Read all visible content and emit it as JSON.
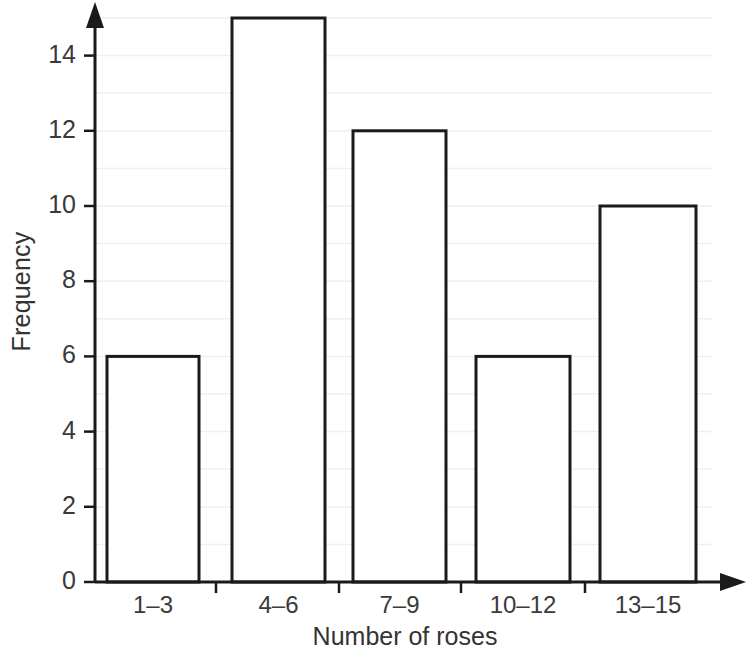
{
  "chart_data": {
    "type": "bar",
    "title": "",
    "subtitle": "",
    "xlabel": "Number of roses",
    "ylabel": "Frequency",
    "categories": [
      "1–3",
      "4–6",
      "7–9",
      "10–12",
      "13–15"
    ],
    "values": [
      6,
      15,
      12,
      6,
      10
    ],
    "yticks": [
      0,
      2,
      4,
      6,
      8,
      10,
      12,
      14
    ],
    "ytick_labels": [
      "0",
      "2",
      "4",
      "6",
      "8",
      "10",
      "12",
      "14"
    ],
    "minor_gridlines": [
      1,
      3,
      5,
      7,
      9,
      11,
      13,
      15
    ],
    "ylim": [
      0,
      15.6
    ],
    "xlim": [
      0,
      5
    ],
    "grid": true,
    "grid_color": "#f0eef0",
    "legend": null,
    "bar_fill": "#ffffff",
    "bar_edge_color": "#1a1a1a",
    "axis_color": "#1a1a1a",
    "text_color": "#333333",
    "background": "#ffffff"
  },
  "axes": {
    "y_arrow": true,
    "x_arrow": true
  }
}
